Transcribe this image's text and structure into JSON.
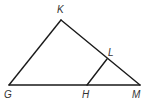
{
  "diagram": {
    "type": "geometry-figure",
    "points": [
      {
        "name": "K",
        "label": "K"
      },
      {
        "name": "G",
        "label": "G"
      },
      {
        "name": "M",
        "label": "M"
      },
      {
        "name": "L",
        "label": "L"
      },
      {
        "name": "H",
        "label": "H"
      }
    ],
    "segments": [
      {
        "from": "G",
        "to": "K"
      },
      {
        "from": "K",
        "to": "M"
      },
      {
        "from": "G",
        "to": "M"
      },
      {
        "from": "L",
        "to": "H"
      }
    ],
    "line_color": "#1a1a1a",
    "label_color": "#333333"
  }
}
